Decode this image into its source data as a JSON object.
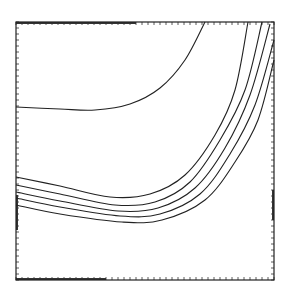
{
  "chart_data": {
    "type": "line",
    "title": "",
    "xlabel": "",
    "ylabel": "",
    "grid": false,
    "legend": null,
    "frame": {
      "left": 16,
      "top": 22,
      "right": 274,
      "bottom": 280
    },
    "tick_spacing_px": 6,
    "line_color": "#222222",
    "series": [
      {
        "name": "curve-1",
        "points": [
          [
            16,
            107
          ],
          [
            60,
            109
          ],
          [
            95,
            110
          ],
          [
            130,
            104
          ],
          [
            160,
            88
          ],
          [
            185,
            60
          ],
          [
            205,
            22
          ]
        ]
      },
      {
        "name": "curve-2",
        "points": [
          [
            16,
            177
          ],
          [
            60,
            186
          ],
          [
            110,
            197
          ],
          [
            150,
            194
          ],
          [
            185,
            175
          ],
          [
            215,
            135
          ],
          [
            235,
            90
          ],
          [
            248,
            22
          ]
        ]
      },
      {
        "name": "curve-3",
        "points": [
          [
            16,
            185
          ],
          [
            60,
            194
          ],
          [
            115,
            205
          ],
          [
            155,
            202
          ],
          [
            190,
            182
          ],
          [
            220,
            140
          ],
          [
            245,
            90
          ],
          [
            262,
            22
          ]
        ]
      },
      {
        "name": "curve-4",
        "points": [
          [
            16,
            192
          ],
          [
            60,
            201
          ],
          [
            118,
            211
          ],
          [
            158,
            208
          ],
          [
            195,
            188
          ],
          [
            225,
            148
          ],
          [
            250,
            95
          ],
          [
            270,
            24
          ]
        ]
      },
      {
        "name": "curve-5",
        "points": [
          [
            16,
            198
          ],
          [
            60,
            207
          ],
          [
            120,
            216
          ],
          [
            160,
            214
          ],
          [
            200,
            194
          ],
          [
            230,
            154
          ],
          [
            255,
            105
          ],
          [
            274,
            40
          ]
        ]
      },
      {
        "name": "curve-6",
        "points": [
          [
            16,
            205
          ],
          [
            60,
            214
          ],
          [
            122,
            222
          ],
          [
            162,
            220
          ],
          [
            205,
            200
          ],
          [
            235,
            162
          ],
          [
            258,
            120
          ],
          [
            274,
            60
          ]
        ]
      }
    ]
  }
}
